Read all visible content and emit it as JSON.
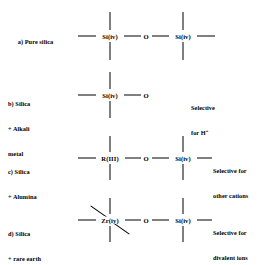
{
  "figure": {
    "type": "chemistry-structure-diagram",
    "background": "#ffffff",
    "ink": "#000000",
    "rows": [
      {
        "id": "a",
        "label_lines": [
          "a) Pure silica"
        ],
        "atoms": [
          "Si(iv)",
          "O",
          "Si(iv)"
        ],
        "note_lines": [],
        "terminal_left_bond": true,
        "terminal_right_bond": true
      },
      {
        "id": "b",
        "label_lines": [
          "b) Silica",
          "+ Alkali",
          "metal"
        ],
        "atoms": [
          "Si(iv)",
          "O"
        ],
        "note_lines": [
          "Selective",
          "for H+"
        ],
        "note_superscript": "+",
        "terminal_left_bond": true,
        "terminal_right_bond": false
      },
      {
        "id": "c",
        "label_lines": [
          "c) Silica",
          "+ Alumina"
        ],
        "atoms": [
          "R(III)",
          "O",
          "Si(iv)"
        ],
        "note_lines": [
          "Selective for",
          "other cations"
        ],
        "terminal_left_bond": true,
        "terminal_right_bond": true
      },
      {
        "id": "d",
        "label_lines": [
          "d) Silica",
          "+ rare earth"
        ],
        "atoms": [
          "Zr(iv)",
          "O",
          "Si(iv)"
        ],
        "note_lines": [
          "Selective for",
          "divalent ions"
        ],
        "terminal_left_bond": true,
        "terminal_right_bond": true,
        "extra_diagonal_bonds": 2
      }
    ]
  },
  "labels": {
    "a_line1": "a) Pure silica",
    "b_line1": "b) Silica",
    "b_line2": "+ Alkali",
    "b_line3": "metal",
    "c_line1": "c) Silica",
    "c_line2": "+ Alumina",
    "d_line1": "d) Silica",
    "d_line2": "+ rare earth"
  },
  "atoms": {
    "a_si_left": "Si(iv)",
    "a_o": "O",
    "a_si_right": "Si(iv)",
    "b_si": "Si(iv)",
    "b_o": "O",
    "c_r": "R(III)",
    "c_o": "O",
    "c_si": "Si(iv)",
    "d_zr": "Zr(iv)",
    "d_o": "O",
    "d_si": "Si(iv)"
  },
  "notes": {
    "b_line1": "Selective",
    "b_line2_pre": "for H",
    "b_line2_sup": "+",
    "c_line1": "Selective for",
    "c_line2": "other cations",
    "d_line1": "Selective for",
    "d_line2": "divalent ions"
  }
}
